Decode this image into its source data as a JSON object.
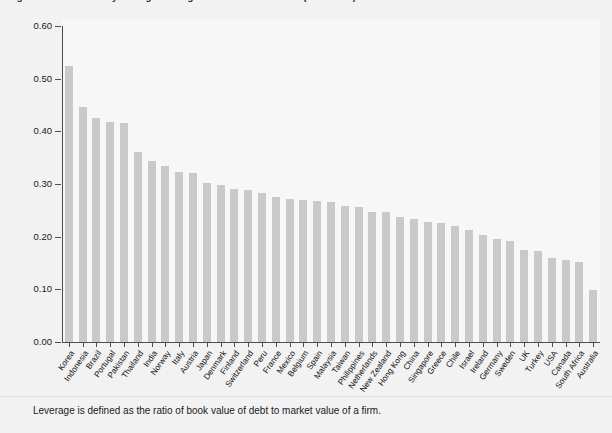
{
  "title": "Figure 1.  Cross-country average leverage of non-financial firms (2000-2015)",
  "footnote": "Leverage is defined as the ratio of book value of debt to market value of a firm.",
  "colors": {
    "bar": "#c9c9c9",
    "axis": "#4d4d4d",
    "plot_background": "#f7f7f7",
    "page_background": "#f2f2f2",
    "text": "#1a1a1a"
  },
  "axis": {
    "y_ticks": [
      "0.60",
      "0.50",
      "0.40",
      "0.30",
      "0.20",
      "0.10",
      "0.00"
    ],
    "y_tick_values": [
      0.6,
      0.5,
      0.4,
      0.3,
      0.2,
      0.1,
      0.0
    ]
  },
  "chart_data": {
    "type": "bar",
    "title": "Figure 1.  Cross-country average leverage of non-financial firms (2000-2015)",
    "xlabel": "",
    "ylabel": "",
    "ylim": [
      0.0,
      0.6
    ],
    "grid": false,
    "legend": "none",
    "categories": [
      "Korea",
      "Indonesia",
      "Brazil",
      "Portugal",
      "Pakistan",
      "Thailand",
      "India",
      "Norway",
      "Italy",
      "Austria",
      "Japan",
      "Denmark",
      "Finland",
      "Switzerland",
      "Peru",
      "France",
      "Mexico",
      "Belgium",
      "Spain",
      "Malaysia",
      "Taiwan",
      "Philippines",
      "Netherlands",
      "New Zealand",
      "Hong Kong",
      "China",
      "Singapore",
      "Greece",
      "Chile",
      "Israel",
      "Ireland",
      "Germany",
      "Sweden",
      "UK",
      "Turkey",
      "USA",
      "Canada",
      "South Africa",
      "Australia"
    ],
    "values": [
      0.524,
      0.446,
      0.425,
      0.418,
      0.416,
      0.36,
      0.343,
      0.335,
      0.322,
      0.32,
      0.301,
      0.299,
      0.291,
      0.288,
      0.283,
      0.276,
      0.271,
      0.269,
      0.268,
      0.266,
      0.258,
      0.257,
      0.247,
      0.246,
      0.238,
      0.234,
      0.228,
      0.226,
      0.221,
      0.212,
      0.204,
      0.196,
      0.191,
      0.175,
      0.172,
      0.159,
      0.155,
      0.152,
      0.099
    ]
  }
}
